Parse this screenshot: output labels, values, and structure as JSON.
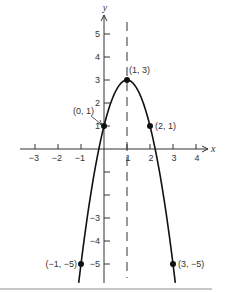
{
  "chart_data": {
    "type": "line",
    "title": "",
    "xlabel": "x",
    "ylabel": "y",
    "xlim": [
      -3,
      4
    ],
    "ylim": [
      -5,
      5
    ],
    "grid": false,
    "function": "y = -2(x - 1)^2 + 3",
    "x_ticks": [
      -3,
      -2,
      -1,
      1,
      2,
      3,
      4
    ],
    "x_tick_labels": [
      "−3",
      "−2",
      "−1",
      "1",
      "2",
      "3",
      "4"
    ],
    "y_ticks": [
      1,
      2,
      3,
      4,
      5,
      -1,
      -2,
      -3,
      -4,
      -5
    ],
    "y_tick_labels": [
      "1",
      "2",
      "3",
      "4",
      "5",
      "",
      "",
      "−3",
      "−4",
      "−5"
    ],
    "axis_of_symmetry": {
      "x": 1,
      "style": "dashed"
    },
    "series": [
      {
        "name": "parabola",
        "x": [
          -1.1,
          -1,
          -0.5,
          0,
          0.5,
          1,
          1.5,
          2,
          2.5,
          3,
          3.1
        ],
        "y": [
          -5.82,
          -5,
          -1.5,
          1,
          2.5,
          3,
          2.5,
          1,
          -1.5,
          -5,
          -5.82
        ]
      }
    ],
    "points": [
      {
        "x": 1,
        "y": 3,
        "label": "(1, 3)"
      },
      {
        "x": 0,
        "y": 1,
        "label": "(0, 1)"
      },
      {
        "x": 2,
        "y": 1,
        "label": "(2, 1)"
      },
      {
        "x": -1,
        "y": -5,
        "label": "(−1, −5)"
      },
      {
        "x": 3,
        "y": -5,
        "label": "(3, −5)"
      }
    ]
  },
  "layout": {
    "origin_px": [
      104,
      149
    ],
    "unit_px": 23,
    "axis_color": "#333333",
    "curve_color": "#111111",
    "footer_line_color": "#c8c8c8"
  }
}
